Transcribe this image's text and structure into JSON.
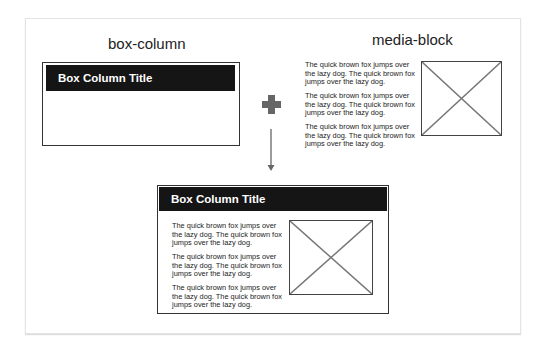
{
  "labels": {
    "left": "box-column",
    "right": "media-block"
  },
  "box_column": {
    "title": "Box Column Title"
  },
  "media_block": {
    "paragraphs": [
      "The quick brown fox jumps over the lazy dog. The quick brown fox jumps over the lazy dog.",
      "The quick brown fox jumps over the lazy dog. The quick brown fox jumps over the lazy dog.",
      "The quick brown fox jumps over the lazy dog. The quick brown fox jumps over the lazy dog."
    ],
    "image": "placeholder-image-icon"
  },
  "operators": {
    "plus": "plus-icon",
    "arrow": "arrow-down-icon",
    "color": "#666666"
  },
  "result": {
    "title": "Box Column Title",
    "paragraphs": [
      "The quick brown fox jumps over the lazy dog. The quick brown fox jumps over the lazy dog.",
      "The quick brown fox jumps over the lazy dog. The quick brown fox jumps over the lazy dog.",
      "The quick brown fox jumps over the lazy dog. The quick brown fox jumps over the lazy dog."
    ]
  }
}
